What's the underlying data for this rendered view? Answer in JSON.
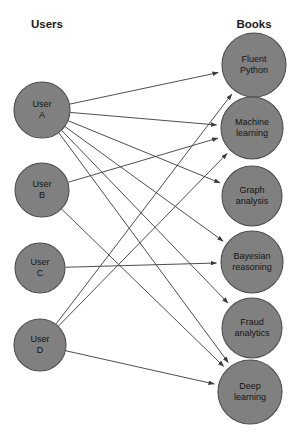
{
  "diagram": {
    "type": "bipartite-graph",
    "background_color": "#ffffff",
    "node_fill_color": "#808080",
    "node_stroke_color": "#4d4d4d",
    "edge_color": "#3a3a3a",
    "columns": {
      "left_header": "Users",
      "right_header": "Books"
    }
  },
  "users": [
    {
      "id": "A",
      "line1": "User",
      "line2": "A",
      "cx": 42,
      "cy": 110,
      "r": 28
    },
    {
      "id": "B",
      "line1": "User",
      "line2": "B",
      "cx": 42,
      "cy": 190,
      "r": 27
    },
    {
      "id": "C",
      "line1": "User",
      "line2": "C",
      "cx": 40,
      "cy": 268,
      "r": 25
    },
    {
      "id": "D",
      "line1": "User",
      "line2": "D",
      "cx": 40,
      "cy": 345,
      "r": 26
    }
  ],
  "books": [
    {
      "id": "fluent_python",
      "line1": "Fluent",
      "line2": "Python",
      "cx": 254,
      "cy": 65,
      "r": 32
    },
    {
      "id": "machine_learning",
      "line1": "Machine",
      "line2": "learning",
      "cx": 252,
      "cy": 128,
      "r": 31
    },
    {
      "id": "graph_analysis",
      "line1": "Graph",
      "line2": "analysis",
      "cx": 252,
      "cy": 196,
      "r": 30
    },
    {
      "id": "bayesian_reasoning",
      "line1": "Bayesian",
      "line2": "reasoning",
      "cx": 252,
      "cy": 262,
      "r": 31
    },
    {
      "id": "fraud_analytics",
      "line1": "Fraud",
      "line2": "analytics",
      "cx": 252,
      "cy": 328,
      "r": 30
    },
    {
      "id": "deep_learning",
      "line1": "Deep",
      "line2": "learning",
      "cx": 250,
      "cy": 392,
      "r": 32
    }
  ],
  "edges": [
    {
      "from": "A",
      "to": "fluent_python"
    },
    {
      "from": "A",
      "to": "machine_learning"
    },
    {
      "from": "A",
      "to": "graph_analysis"
    },
    {
      "from": "A",
      "to": "bayesian_reasoning"
    },
    {
      "from": "A",
      "to": "fraud_analytics"
    },
    {
      "from": "A",
      "to": "deep_learning"
    },
    {
      "from": "B",
      "to": "machine_learning"
    },
    {
      "from": "B",
      "to": "deep_learning"
    },
    {
      "from": "C",
      "to": "bayesian_reasoning"
    },
    {
      "from": "D",
      "to": "fluent_python"
    },
    {
      "from": "D",
      "to": "machine_learning"
    },
    {
      "from": "D",
      "to": "deep_learning"
    }
  ],
  "headers": {
    "users_x": 47,
    "users_y": 28,
    "books_x": 254,
    "books_y": 28
  }
}
